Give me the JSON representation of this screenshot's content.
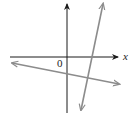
{
  "figure": {
    "labels": {
      "origin": "0",
      "x_axis": "x"
    },
    "colors": {
      "axis": "#1a1a1a",
      "line": "#8c8c8c",
      "background": "#ffffff"
    },
    "axes": {
      "x_axis": {
        "x1": 10,
        "y1": 57,
        "x2": 118,
        "y2": 57
      },
      "y_axis": {
        "x1": 67,
        "y1": 113,
        "x2": 67,
        "y2": 4
      }
    },
    "lines": [
      {
        "name": "shallow-negative-slope-line",
        "x1": 12,
        "y1": 63,
        "x2": 119,
        "y2": 84
      },
      {
        "name": "steep-positive-slope-line",
        "x1": 81,
        "y1": 110,
        "x2": 103,
        "y2": 4
      }
    ]
  }
}
